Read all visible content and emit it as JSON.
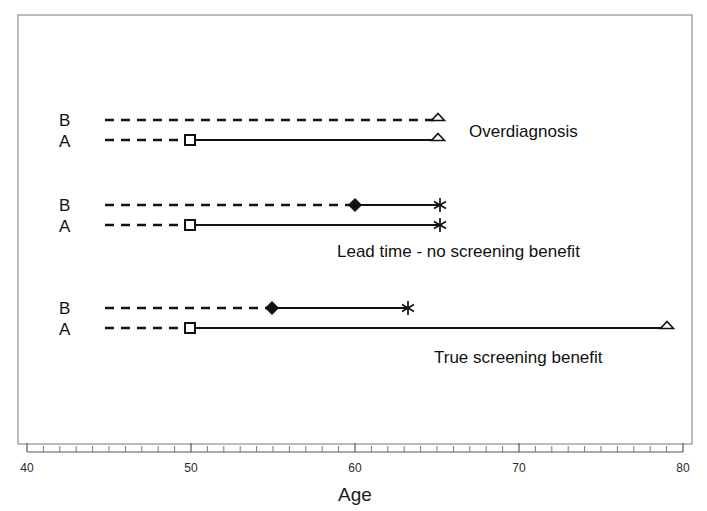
{
  "chart_data": {
    "type": "line",
    "title": "",
    "xlabel": "Age",
    "ylabel": "",
    "xlim": [
      40,
      80
    ],
    "xticks": [
      40,
      50,
      60,
      70,
      80
    ],
    "xtick_labels": [
      "40",
      "50",
      "60",
      "70",
      "80"
    ],
    "minor_tick_step": 1,
    "grid": false,
    "legend": "none",
    "series": [
      {
        "name": "Overdiagnosis B",
        "group": "Overdiagnosis",
        "row_label": "B",
        "preclinical_start": 45,
        "clinical_start": 65,
        "end": 65,
        "start_marker": "none",
        "mid_marker": "none",
        "end_marker": "open-triangle",
        "dashed_from": 45,
        "dashed_to": 65,
        "solid_from": 65,
        "solid_to": 65
      },
      {
        "name": "Overdiagnosis A",
        "group": "Overdiagnosis",
        "row_label": "A",
        "preclinical_start": 45,
        "clinical_start": 50,
        "end": 65,
        "start_marker": "open-square",
        "start_marker_x": 50,
        "mid_marker": "none",
        "end_marker": "open-triangle",
        "dashed_from": 45,
        "dashed_to": 50,
        "solid_from": 50,
        "solid_to": 65
      },
      {
        "name": "Lead time B",
        "group": "Lead time - no screening benefit",
        "row_label": "B",
        "preclinical_start": 45,
        "clinical_start": 60,
        "end": 65,
        "start_marker": "none",
        "mid_marker": "filled-diamond",
        "mid_marker_x": 60,
        "end_marker": "asterisk",
        "dashed_from": 45,
        "dashed_to": 60,
        "solid_from": 60,
        "solid_to": 65
      },
      {
        "name": "Lead time A",
        "group": "Lead time - no screening benefit",
        "row_label": "A",
        "preclinical_start": 45,
        "clinical_start": 50,
        "end": 65,
        "start_marker": "open-square",
        "start_marker_x": 50,
        "mid_marker": "none",
        "end_marker": "asterisk",
        "dashed_from": 45,
        "dashed_to": 50,
        "solid_from": 50,
        "solid_to": 65
      },
      {
        "name": "True benefit B",
        "group": "True screening benefit",
        "row_label": "B",
        "preclinical_start": 45,
        "clinical_start": 55,
        "end": 63,
        "start_marker": "none",
        "mid_marker": "filled-diamond",
        "mid_marker_x": 55,
        "end_marker": "asterisk",
        "dashed_from": 45,
        "dashed_to": 55,
        "solid_from": 55,
        "solid_to": 63
      },
      {
        "name": "True benefit A",
        "group": "True screening benefit",
        "row_label": "A",
        "preclinical_start": 45,
        "clinical_start": 50,
        "end": 79,
        "start_marker": "open-square",
        "start_marker_x": 50,
        "mid_marker": "none",
        "end_marker": "open-triangle",
        "dashed_from": 45,
        "dashed_to": 50,
        "solid_from": 50,
        "solid_to": 79
      }
    ],
    "annotations": [
      {
        "text": "Overdiagnosis",
        "x": 69.0,
        "row": 0
      },
      {
        "text": "Lead time - no screening benefit",
        "x": 60.0,
        "row": 1
      },
      {
        "text": "True screening benefit",
        "x": 65.0,
        "row": 2
      }
    ]
  },
  "axis": {
    "x_title": "Age",
    "tick_40": "40",
    "tick_50": "50",
    "tick_60": "60",
    "tick_70": "70",
    "tick_80": "80"
  },
  "rows": {
    "group1_b": "B",
    "group1_a": "A",
    "group2_b": "B",
    "group2_a": "A",
    "group3_b": "B",
    "group3_a": "A"
  },
  "annotations": {
    "overdiagnosis": "Overdiagnosis",
    "lead_time": "Lead time - no screening benefit",
    "true_benefit": "True screening benefit"
  },
  "colors": {
    "line": "#121212",
    "frame": "#9a9a9a",
    "text": "#111111"
  }
}
